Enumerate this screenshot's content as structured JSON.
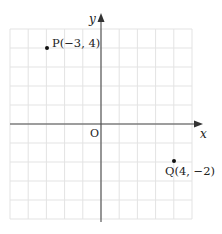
{
  "diagram": {
    "type": "coordinate-plane",
    "axes": {
      "x_label": "x",
      "y_label": "y",
      "origin_label": "O",
      "x_range": [
        -5,
        5
      ],
      "y_range": [
        -5,
        5
      ],
      "grid": true
    },
    "points": [
      {
        "name": "P",
        "x": -3,
        "y": 4,
        "label": "P(−3, 4)"
      },
      {
        "name": "Q",
        "x": 4,
        "y": -2,
        "label": "Q(4, −2)"
      }
    ],
    "colors": {
      "grid": "#e3e3e3",
      "axis": "#4a4a4a",
      "point": "#111111",
      "text": "#222222"
    }
  }
}
